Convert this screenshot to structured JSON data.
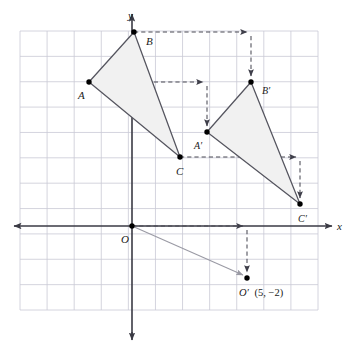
{
  "figure": {
    "type": "coordinate-geometry-diagram",
    "axes": {
      "x_label": "x",
      "y_label": "y",
      "origin_label": "O"
    },
    "grid": {
      "visible": true,
      "color": "#c9c9d6",
      "x_min_px": 20,
      "x_max_px": 318,
      "cell_w_px": 27.09,
      "y_min_px": 31,
      "y_max_px": 310,
      "cell_h_px": 25.36,
      "cols": 11,
      "rows": 11
    },
    "origin_px": {
      "x": 132,
      "y": 226
    },
    "unit_px": {
      "x": 27.09,
      "y": 25.36
    },
    "translation_vector": {
      "x": 5,
      "y": -2,
      "text": "(5, −2)"
    },
    "styles": {
      "triangle_fill": "#f0f0f0",
      "triangle_stroke": "#555560",
      "axis_color": "#3a3a44",
      "dashed_color": "#55555f",
      "point_color": "#000000",
      "vector_color": "#9a9aa4"
    },
    "points": [
      {
        "name": "A",
        "label": "A",
        "px": [
          89,
          82
        ],
        "label_px": [
          78,
          99
        ],
        "label_prime": false
      },
      {
        "name": "B",
        "label": "B",
        "px": [
          134,
          32
        ],
        "label_px": [
          146,
          45
        ],
        "label_prime": false
      },
      {
        "name": "C",
        "label": "C",
        "px": [
          180,
          157
        ],
        "label_px": [
          176,
          175
        ],
        "label_prime": false
      },
      {
        "name": "Ap",
        "label": "A′",
        "px": [
          207,
          132
        ],
        "label_px": [
          194,
          149
        ],
        "label_prime": true
      },
      {
        "name": "Bp",
        "label": "B′",
        "px": [
          251,
          82
        ],
        "label_px": [
          262,
          94
        ],
        "label_prime": true
      },
      {
        "name": "Cp",
        "label": "C′",
        "px": [
          300,
          204
        ],
        "label_px": [
          298,
          222
        ],
        "label_prime": true
      },
      {
        "name": "Op",
        "label": "O′",
        "px": [
          247,
          278
        ],
        "label_px": [
          240,
          296
        ],
        "label_prime": true
      },
      {
        "name": "O",
        "label": "O",
        "px": [
          132,
          226
        ],
        "label_px": [
          121,
          243
        ],
        "label_prime": false
      }
    ],
    "triangles": [
      {
        "name": "ABC",
        "vertices": [
          "A",
          "B",
          "C"
        ],
        "label": "△ABC"
      },
      {
        "name": "ApBpCp",
        "vertices": [
          "Ap",
          "Bp",
          "Cp"
        ],
        "label": "△A′B′C′"
      }
    ],
    "mapping_arrows": [
      {
        "from": "A",
        "to": "Ap",
        "style": "dashed-elbow"
      },
      {
        "from": "B",
        "to": "Bp",
        "style": "dashed-elbow"
      },
      {
        "from": "C",
        "to": "Cp",
        "style": "dashed-elbow"
      },
      {
        "from": "O",
        "to": "Op",
        "style": "dashed-elbow"
      }
    ],
    "vector_arrow": {
      "from": "O",
      "to": "Op",
      "style": "solid-thin"
    },
    "annotation": {
      "op_label": "O′",
      "op_coords": "(5, −2)",
      "op_full": "O′ (5, −2)"
    }
  }
}
